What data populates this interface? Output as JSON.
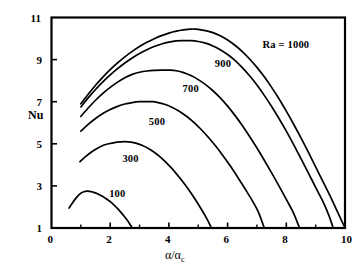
{
  "chart_data": {
    "type": "line",
    "title": "",
    "xlabel": "α/αc",
    "xlabel_main": "α/α",
    "xlabel_sub": "c",
    "ylabel": "Nu",
    "xlim": [
      0,
      10
    ],
    "ylim": [
      1,
      11
    ],
    "xticks": [
      0,
      2,
      4,
      6,
      8,
      10
    ],
    "xtick_labels": [
      "0",
      "2",
      "4",
      "6",
      "8",
      "10"
    ],
    "xminor_ticks": [
      1,
      3,
      5,
      7,
      9
    ],
    "yticks": [
      1,
      3,
      5,
      7,
      9,
      11
    ],
    "ytick_labels": [
      "1",
      "3",
      "5",
      "7",
      "9",
      "11"
    ],
    "grid": false,
    "legend_position": "inline-annotations",
    "line_color": "#000000",
    "frame_color": "#000000",
    "series": [
      {
        "name": "Ra = 1000",
        "label": "Ra  =  1000",
        "label_x": 8.05,
        "label_y": 9.65,
        "peak": {
          "x": 4.9,
          "y": 10.45
        },
        "points": [
          [
            1.0,
            6.9
          ],
          [
            1.25,
            7.35
          ],
          [
            1.5,
            7.78
          ],
          [
            1.75,
            8.17
          ],
          [
            2.0,
            8.52
          ],
          [
            2.25,
            8.84
          ],
          [
            2.5,
            9.13
          ],
          [
            2.75,
            9.39
          ],
          [
            3.0,
            9.62
          ],
          [
            3.25,
            9.82
          ],
          [
            3.5,
            9.99
          ],
          [
            3.75,
            10.14
          ],
          [
            4.0,
            10.26
          ],
          [
            4.25,
            10.35
          ],
          [
            4.5,
            10.41
          ],
          [
            4.75,
            10.45
          ],
          [
            4.9,
            10.45
          ],
          [
            5.0,
            10.44
          ],
          [
            5.25,
            10.38
          ],
          [
            5.5,
            10.28
          ],
          [
            5.75,
            10.13
          ],
          [
            6.0,
            9.93
          ],
          [
            6.25,
            9.68
          ],
          [
            6.5,
            9.38
          ],
          [
            6.75,
            9.03
          ],
          [
            7.0,
            8.63
          ],
          [
            7.25,
            8.18
          ],
          [
            7.5,
            7.68
          ],
          [
            7.75,
            7.14
          ],
          [
            8.0,
            6.55
          ],
          [
            8.25,
            5.93
          ],
          [
            8.5,
            5.28
          ],
          [
            8.75,
            4.6
          ],
          [
            9.0,
            3.9
          ],
          [
            9.25,
            3.2
          ],
          [
            9.5,
            2.5
          ],
          [
            9.75,
            1.75
          ],
          [
            10.0,
            1.0
          ]
        ]
      },
      {
        "name": "900",
        "label": "900",
        "label_x": 5.8,
        "label_y": 8.75,
        "peak": {
          "x": 4.75,
          "y": 9.9
        },
        "points": [
          [
            1.0,
            6.75
          ],
          [
            1.25,
            7.18
          ],
          [
            1.5,
            7.58
          ],
          [
            1.75,
            7.94
          ],
          [
            2.0,
            8.27
          ],
          [
            2.25,
            8.57
          ],
          [
            2.5,
            8.84
          ],
          [
            2.75,
            9.08
          ],
          [
            3.0,
            9.29
          ],
          [
            3.25,
            9.47
          ],
          [
            3.5,
            9.62
          ],
          [
            3.75,
            9.74
          ],
          [
            4.0,
            9.83
          ],
          [
            4.25,
            9.89
          ],
          [
            4.5,
            9.9
          ],
          [
            4.75,
            9.9
          ],
          [
            5.0,
            9.86
          ],
          [
            5.25,
            9.78
          ],
          [
            5.5,
            9.65
          ],
          [
            5.75,
            9.47
          ],
          [
            6.0,
            9.24
          ],
          [
            6.25,
            8.96
          ],
          [
            6.5,
            8.62
          ],
          [
            6.75,
            8.23
          ],
          [
            7.0,
            7.79
          ],
          [
            7.25,
            7.3
          ],
          [
            7.5,
            6.77
          ],
          [
            7.75,
            6.2
          ],
          [
            8.0,
            5.6
          ],
          [
            8.25,
            4.96
          ],
          [
            8.5,
            4.3
          ],
          [
            8.75,
            3.62
          ],
          [
            9.0,
            2.93
          ],
          [
            9.25,
            2.25
          ],
          [
            9.45,
            1.6
          ],
          [
            9.6,
            1.0
          ]
        ]
      },
      {
        "name": "700",
        "label": "700",
        "label_x": 4.7,
        "label_y": 7.55,
        "peak": {
          "x": 4.05,
          "y": 8.5
        },
        "points": [
          [
            1.0,
            6.3
          ],
          [
            1.25,
            6.7
          ],
          [
            1.5,
            7.07
          ],
          [
            1.75,
            7.4
          ],
          [
            2.0,
            7.68
          ],
          [
            2.25,
            7.93
          ],
          [
            2.5,
            8.14
          ],
          [
            2.75,
            8.3
          ],
          [
            3.0,
            8.4
          ],
          [
            3.25,
            8.46
          ],
          [
            3.5,
            8.49
          ],
          [
            3.75,
            8.5
          ],
          [
            4.05,
            8.5
          ],
          [
            4.25,
            8.47
          ],
          [
            4.5,
            8.38
          ],
          [
            4.75,
            8.24
          ],
          [
            5.0,
            8.05
          ],
          [
            5.25,
            7.81
          ],
          [
            5.5,
            7.52
          ],
          [
            5.75,
            7.18
          ],
          [
            6.0,
            6.79
          ],
          [
            6.25,
            6.35
          ],
          [
            6.5,
            5.87
          ],
          [
            6.75,
            5.35
          ],
          [
            7.0,
            4.8
          ],
          [
            7.25,
            4.22
          ],
          [
            7.5,
            3.62
          ],
          [
            7.75,
            3.0
          ],
          [
            8.0,
            2.36
          ],
          [
            8.25,
            1.7
          ],
          [
            8.45,
            1.0
          ]
        ]
      },
      {
        "name": "500",
        "label": "500",
        "label_x": 3.55,
        "label_y": 6.0,
        "peak": {
          "x": 3.45,
          "y": 7.0
        },
        "points": [
          [
            1.0,
            5.6
          ],
          [
            1.25,
            5.92
          ],
          [
            1.5,
            6.2
          ],
          [
            1.75,
            6.44
          ],
          [
            2.0,
            6.63
          ],
          [
            2.25,
            6.78
          ],
          [
            2.5,
            6.89
          ],
          [
            2.75,
            6.96
          ],
          [
            3.0,
            7.0
          ],
          [
            3.25,
            7.0
          ],
          [
            3.45,
            7.0
          ],
          [
            3.6,
            6.97
          ],
          [
            3.85,
            6.88
          ],
          [
            4.1,
            6.74
          ],
          [
            4.35,
            6.55
          ],
          [
            4.6,
            6.31
          ],
          [
            4.85,
            6.02
          ],
          [
            5.1,
            5.68
          ],
          [
            5.35,
            5.3
          ],
          [
            5.6,
            4.88
          ],
          [
            5.85,
            4.42
          ],
          [
            6.1,
            3.93
          ],
          [
            6.35,
            3.4
          ],
          [
            6.6,
            2.85
          ],
          [
            6.85,
            2.28
          ],
          [
            7.05,
            1.75
          ],
          [
            7.25,
            1.0
          ]
        ]
      },
      {
        "name": "300",
        "label": "300",
        "label_x": 2.65,
        "label_y": 4.25,
        "peak": {
          "x": 2.5,
          "y": 5.1
        },
        "points": [
          [
            0.97,
            4.15
          ],
          [
            1.15,
            4.38
          ],
          [
            1.35,
            4.6
          ],
          [
            1.55,
            4.78
          ],
          [
            1.75,
            4.92
          ],
          [
            1.95,
            5.0
          ],
          [
            2.15,
            5.06
          ],
          [
            2.35,
            5.09
          ],
          [
            2.5,
            5.1
          ],
          [
            2.7,
            5.08
          ],
          [
            2.9,
            5.02
          ],
          [
            3.1,
            4.92
          ],
          [
            3.3,
            4.78
          ],
          [
            3.5,
            4.6
          ],
          [
            3.7,
            4.38
          ],
          [
            3.9,
            4.12
          ],
          [
            4.1,
            3.83
          ],
          [
            4.3,
            3.5
          ],
          [
            4.5,
            3.15
          ],
          [
            4.7,
            2.77
          ],
          [
            4.9,
            2.35
          ],
          [
            5.1,
            1.9
          ],
          [
            5.3,
            1.42
          ],
          [
            5.45,
            1.0
          ]
        ]
      },
      {
        "name": "100",
        "label": "100",
        "label_x": 2.2,
        "label_y": 2.55,
        "peak": {
          "x": 1.2,
          "y": 2.75
        },
        "points": [
          [
            0.6,
            1.95
          ],
          [
            0.7,
            2.16
          ],
          [
            0.8,
            2.36
          ],
          [
            0.9,
            2.53
          ],
          [
            1.0,
            2.65
          ],
          [
            1.1,
            2.72
          ],
          [
            1.2,
            2.75
          ],
          [
            1.3,
            2.74
          ],
          [
            1.4,
            2.71
          ],
          [
            1.55,
            2.64
          ],
          [
            1.7,
            2.53
          ],
          [
            1.85,
            2.4
          ],
          [
            2.0,
            2.25
          ],
          [
            2.15,
            2.06
          ],
          [
            2.3,
            1.85
          ],
          [
            2.45,
            1.6
          ],
          [
            2.6,
            1.33
          ],
          [
            2.75,
            1.0
          ]
        ]
      }
    ]
  }
}
